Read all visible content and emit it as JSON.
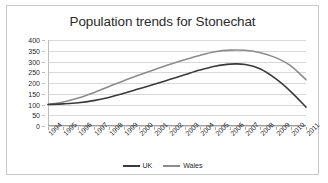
{
  "chart_data": {
    "type": "line",
    "title": "Population trends for Stonechat",
    "xlabel": "",
    "ylabel": "",
    "categories": [
      "1994",
      "1995",
      "1996",
      "1997",
      "1998",
      "1999",
      "2000",
      "2001",
      "2002",
      "2003",
      "2004",
      "2005",
      "2006",
      "2007",
      "2008",
      "2009",
      "2010",
      "2011"
    ],
    "ylim": [
      0,
      400
    ],
    "yticks": [
      0,
      50,
      100,
      150,
      200,
      250,
      300,
      350,
      400
    ],
    "grid": true,
    "legend_position": "bottom",
    "series": [
      {
        "name": "UK",
        "color": "#3a3a3a",
        "values": [
          100,
          103,
          108,
          118,
          133,
          152,
          173,
          194,
          216,
          238,
          260,
          278,
          288,
          286,
          265,
          220,
          160,
          88
        ]
      },
      {
        "name": "Wales",
        "color": "#8c8c8c",
        "values": [
          100,
          112,
          130,
          155,
          183,
          211,
          237,
          262,
          286,
          308,
          328,
          345,
          353,
          352,
          341,
          318,
          280,
          215
        ]
      }
    ]
  },
  "colors": {
    "frame_border": "#c9c9c9",
    "gridline": "#d7d7d7",
    "axis": "#9e9e9e",
    "text": "#1f1f1f",
    "title_text": "#2b2b2b",
    "background": "#ffffff"
  }
}
